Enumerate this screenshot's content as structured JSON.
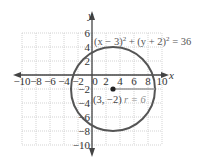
{
  "chart_data": {
    "type": "scatter",
    "title": "",
    "xlabel": "x",
    "ylabel": "y",
    "xlim": [
      -10,
      10
    ],
    "ylim": [
      -10,
      6
    ],
    "grid": true,
    "x_ticks": [
      -10,
      -8,
      -6,
      -4,
      -2,
      0,
      2,
      4,
      6,
      8,
      10
    ],
    "y_ticks": [
      6,
      4,
      2,
      -2,
      -4,
      -6,
      -8,
      -10
    ],
    "x_tick_labels": [
      "−10",
      "−8",
      "−6",
      "−4",
      "−2",
      "0",
      "2",
      "4",
      "6",
      "8",
      "10"
    ],
    "y_tick_labels": [
      "6",
      "4",
      "2",
      "−2",
      "−4",
      "−6",
      "−8",
      "−10"
    ],
    "series": [
      {
        "name": "circle",
        "shape": "circle",
        "center": [
          3,
          -2
        ],
        "radius": 6,
        "equation": "(x − 3)² + (y + 2)² = 36"
      }
    ],
    "annotations": [
      {
        "text": "(x − 3)² + (y + 2)² = 36",
        "x": 0.5,
        "y": 5
      },
      {
        "text": "(3, −2)",
        "x": 0.3,
        "y": -3.5
      },
      {
        "text": "r = 6",
        "x": 6,
        "y": -3.5
      }
    ],
    "colors": {
      "circle": "#555555",
      "radius_line": "#999999",
      "grid": "#c8c8c8",
      "axes": "#444444"
    }
  },
  "labels": {
    "x_axis": "x",
    "y_axis": "y",
    "equation_base_left": "(x − 3)",
    "equation_plus": " + (y + 2)",
    "equation_right": " = 36",
    "exponent": "2",
    "center_label": "(3, −2)",
    "radius_label": "r = 6"
  }
}
